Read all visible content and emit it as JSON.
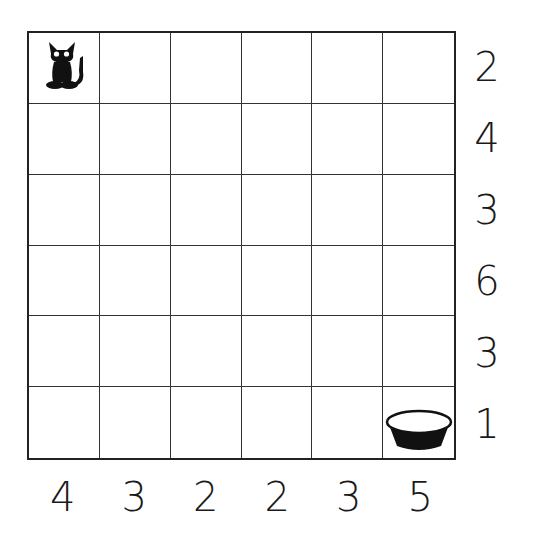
{
  "puzzle": {
    "rows": 6,
    "cols": 6,
    "row_clues": [
      "2",
      "4",
      "3",
      "6",
      "3",
      "1"
    ],
    "col_clues": [
      "4",
      "3",
      "2",
      "2",
      "3",
      "5"
    ],
    "start": {
      "row": 0,
      "col": 0,
      "icon": "cat-icon"
    },
    "goal": {
      "row": 5,
      "col": 5,
      "icon": "bowl-icon"
    },
    "colors": {
      "grid_line": "#333333",
      "text": "#1a1a1a",
      "piece": "#111111",
      "background": "#ffffff"
    }
  }
}
